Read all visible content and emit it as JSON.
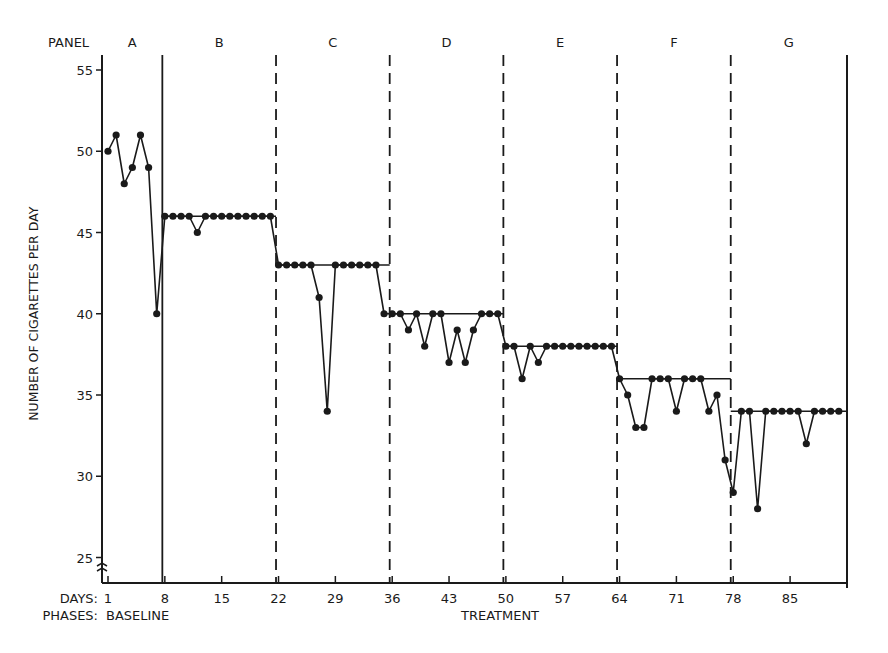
{
  "chart_data": {
    "type": "line",
    "title": "",
    "xlabel": "DAYS",
    "ylabel": "NUMBER OF CIGARETTES PER DAY",
    "ylim": [
      24,
      56
    ],
    "y_ticks": [
      25,
      30,
      35,
      40,
      45,
      50,
      55
    ],
    "x_ticks": [
      1,
      8,
      15,
      22,
      29,
      36,
      43,
      50,
      57,
      64,
      71,
      78,
      85
    ],
    "x_axis_label": "DAYS:",
    "phases_label": "PHASES:",
    "phases": [
      {
        "name": "BASELINE",
        "start_day": 1
      },
      {
        "name": "TREATMENT",
        "start_day": 8
      }
    ],
    "panel_header": "PANEL",
    "panels": [
      {
        "label": "A",
        "start_day": 1,
        "criterion": null,
        "divider": "solid",
        "values": [
          50,
          51,
          48,
          49,
          51,
          49,
          40
        ]
      },
      {
        "label": "B",
        "start_day": 8,
        "criterion": 46,
        "divider": "solid",
        "values": [
          46,
          46,
          46,
          46,
          45,
          46,
          46,
          46,
          46,
          46,
          46,
          46,
          46,
          46
        ]
      },
      {
        "label": "C",
        "start_day": 22,
        "criterion": 43,
        "divider": "dashed",
        "values": [
          43,
          43,
          43,
          43,
          43,
          41,
          34,
          43,
          43,
          43,
          43,
          43,
          43,
          40
        ]
      },
      {
        "label": "D",
        "start_day": 36,
        "criterion": 40,
        "divider": "dashed",
        "values": [
          40,
          40,
          39,
          40,
          38,
          40,
          40,
          37,
          39,
          37,
          39,
          40,
          40,
          40
        ]
      },
      {
        "label": "E",
        "start_day": 50,
        "criterion": 38,
        "divider": "dashed",
        "values": [
          38,
          38,
          36,
          38,
          37,
          38,
          38,
          38,
          38,
          38,
          38,
          38,
          38,
          38
        ]
      },
      {
        "label": "F",
        "start_day": 64,
        "criterion": 36,
        "divider": "dashed",
        "values": [
          36,
          35,
          33,
          33,
          36,
          36,
          36,
          34,
          36,
          36,
          36,
          34,
          35,
          31
        ]
      },
      {
        "label": "G",
        "start_day": 78,
        "criterion": 34,
        "divider": "dashed",
        "values": [
          29,
          34,
          34,
          28,
          34,
          34,
          34,
          34,
          34,
          32,
          34,
          34,
          34,
          34
        ]
      }
    ],
    "grid": false,
    "legend": null
  }
}
